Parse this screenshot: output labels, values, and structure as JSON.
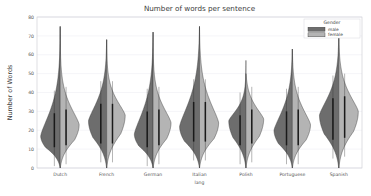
{
  "chart_data": {
    "type": "violin",
    "title": "Number of words per sentence",
    "xlabel": "lang",
    "ylabel": "Number of Words",
    "ylim": [
      0,
      80
    ],
    "yticks": [
      0,
      10,
      20,
      30,
      40,
      50,
      60,
      70,
      80
    ],
    "ytick_labels": [
      "0",
      "10",
      "20",
      "30",
      "40",
      "50",
      "60",
      "70",
      "80"
    ],
    "grid": true,
    "grid_axis": "y",
    "categories": [
      "Dutch",
      "French",
      "German",
      "Italian",
      "Polish",
      "Portuguese",
      "Spanish"
    ],
    "legend": {
      "title": "Gender",
      "position": "upper right",
      "entries": [
        {
          "label": "male",
          "color": "#6d6d6d"
        },
        {
          "label": "female",
          "color": "#b4b4b4"
        }
      ]
    },
    "split": true,
    "series": [
      {
        "name": "male",
        "side": "left",
        "color": "#6d6d6d",
        "groups": [
          {
            "category": "Dutch",
            "min": 0,
            "max": 75,
            "q1": 11,
            "median": 20,
            "q3": 29,
            "peak": 17,
            "peak_width": 1.0
          },
          {
            "category": "French",
            "min": 0,
            "max": 68,
            "q1": 13,
            "median": 24,
            "q3": 34,
            "peak": 25,
            "peak_width": 0.93
          },
          {
            "category": "German",
            "min": 0,
            "max": 72,
            "q1": 11,
            "median": 20,
            "q3": 30,
            "peak": 18,
            "peak_width": 0.96
          },
          {
            "category": "Italian",
            "min": 0,
            "max": 75,
            "q1": 14,
            "median": 26,
            "q3": 35,
            "peak": 22,
            "peak_width": 1.02
          },
          {
            "category": "Polish",
            "min": 0,
            "max": 57,
            "q1": 12,
            "median": 20,
            "q3": 28,
            "peak": 25,
            "peak_width": 0.88
          },
          {
            "category": "Portuguese",
            "min": 0,
            "max": 63,
            "q1": 12,
            "median": 21,
            "q3": 30,
            "peak": 20,
            "peak_width": 0.94
          },
          {
            "category": "Spanish",
            "min": 0,
            "max": 70,
            "q1": 15,
            "median": 27,
            "q3": 37,
            "peak": 28,
            "peak_width": 0.99
          }
        ]
      },
      {
        "name": "female",
        "side": "right",
        "color": "#b4b4b4",
        "groups": [
          {
            "category": "Dutch",
            "min": 0,
            "max": 75,
            "q1": 12,
            "median": 21,
            "q3": 31,
            "peak": 23,
            "peak_width": 0.97
          },
          {
            "category": "French",
            "min": 0,
            "max": 68,
            "q1": 13,
            "median": 24,
            "q3": 34,
            "peak": 28,
            "peak_width": 0.95
          },
          {
            "category": "German",
            "min": 0,
            "max": 72,
            "q1": 12,
            "median": 22,
            "q3": 31,
            "peak": 24,
            "peak_width": 0.92
          },
          {
            "category": "Italian",
            "min": 0,
            "max": 75,
            "q1": 14,
            "median": 26,
            "q3": 35,
            "peak": 24,
            "peak_width": 0.98
          },
          {
            "category": "Polish",
            "min": 0,
            "max": 50,
            "q1": 13,
            "median": 22,
            "q3": 31,
            "peak": 26,
            "peak_width": 0.91
          },
          {
            "category": "Portuguese",
            "min": 0,
            "max": 63,
            "q1": 12,
            "median": 22,
            "q3": 31,
            "peak": 23,
            "peak_width": 0.93
          },
          {
            "category": "Spanish",
            "min": 0,
            "max": 70,
            "q1": 16,
            "median": 28,
            "q3": 38,
            "peak": 30,
            "peak_width": 1.0
          }
        ]
      }
    ]
  }
}
